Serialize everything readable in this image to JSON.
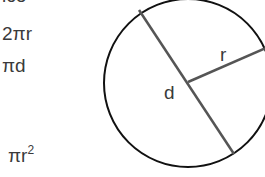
{
  "formulas": {
    "clipped_top": "ice",
    "circumference_radius": "2πr",
    "circumference_diameter": "πd",
    "area_base": "πr",
    "area_exp": "2"
  },
  "diagram": {
    "diameter_label": "d",
    "radius_label": "r"
  }
}
